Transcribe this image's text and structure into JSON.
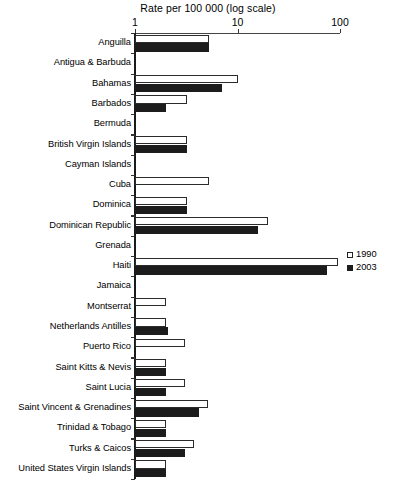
{
  "chart_data": {
    "type": "bar",
    "orientation": "horizontal",
    "title": "Rate per 100 000 (log scale)",
    "xlabel": "Rate per 100 000 (log scale)",
    "ylabel": "",
    "scale": "log",
    "xlim": [
      1,
      100
    ],
    "xticks": [
      1,
      10,
      100
    ],
    "xtick_labels": [
      "1",
      "10",
      "100"
    ],
    "grid": false,
    "legend_position": "right",
    "categories": [
      "Anguilla",
      "Antigua & Barbuda",
      "Bahamas",
      "Barbados",
      "Bermuda",
      "British Virgin Islands",
      "Cayman Islands",
      "Cuba",
      "Dominica",
      "Dominican Republic",
      "Grenada",
      "Haiti",
      "Jamaica",
      "Montserrat",
      "Netherlands Antilles",
      "Puerto Rico",
      "Saint Kitts & Nevis",
      "Saint Lucia",
      "Saint Vincent & Grenadines",
      "Trinidad & Tobago",
      "Turks & Caicos",
      "United States Virgin Islands"
    ],
    "series": [
      {
        "name": "1990",
        "color": "#ffffff",
        "values": [
          5.3,
          null,
          10.0,
          3.2,
          null,
          3.2,
          null,
          5.3,
          3.2,
          20.0,
          null,
          95.0,
          null,
          2.0,
          2.0,
          3.1,
          2.0,
          3.1,
          5.2,
          2.0,
          3.8,
          2.0
        ]
      },
      {
        "name": "2003",
        "color": "#1c1c1c",
        "values": [
          5.3,
          null,
          7.0,
          2.0,
          null,
          3.2,
          null,
          null,
          3.2,
          16.0,
          null,
          75.0,
          null,
          null,
          2.1,
          null,
          2.0,
          2.0,
          4.2,
          2.0,
          3.1,
          2.0
        ]
      }
    ]
  },
  "legend": {
    "items": [
      {
        "label": "1990",
        "style": "white"
      },
      {
        "label": "2003",
        "style": "black"
      }
    ]
  },
  "footnote": ""
}
